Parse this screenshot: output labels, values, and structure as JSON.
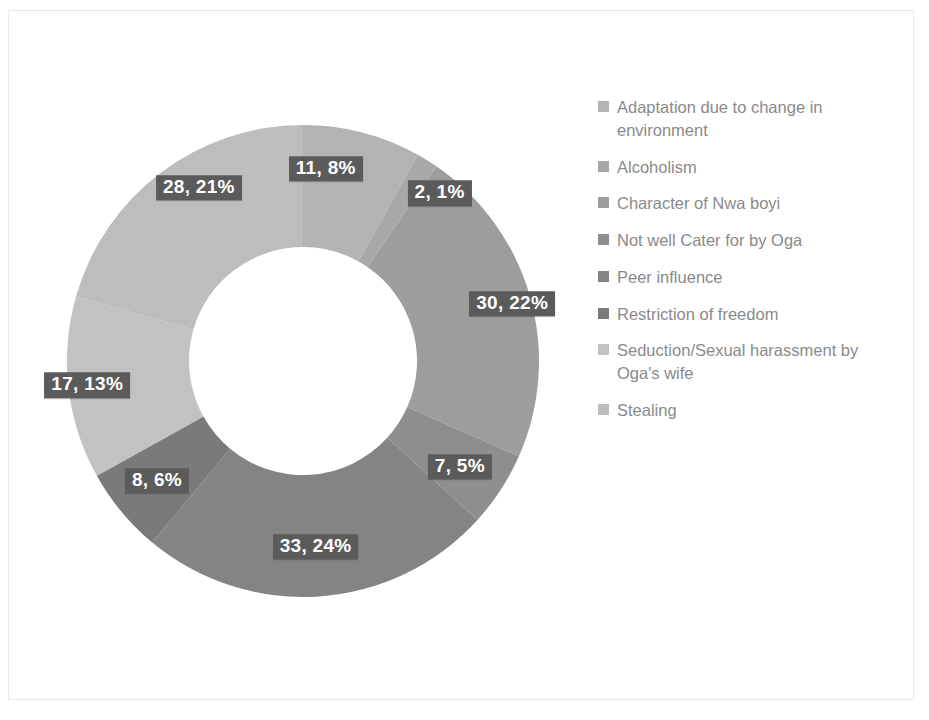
{
  "chart_data": {
    "type": "pie",
    "variant": "doughnut",
    "title": "",
    "subtitle": "",
    "xlabel": "",
    "ylabel": "",
    "grid": false,
    "legend_position": "right",
    "total": 136,
    "label_format": "value, percent",
    "start_angle_deg": 0,
    "direction": "clockwise",
    "categories": [
      "Adaptation due to change in environment",
      "Alcoholism",
      "Character of Nwa boyi",
      "Not well Cater for by Oga",
      "Peer influence",
      "Restriction of freedom",
      "Seduction/Sexual harassment by Oga's wife",
      "Stealing"
    ],
    "values": [
      11,
      2,
      30,
      7,
      33,
      8,
      17,
      28
    ],
    "percents": [
      8,
      1,
      22,
      5,
      24,
      6,
      13,
      21
    ],
    "colors": [
      "#b3b3b3",
      "#a8a8a8",
      "#9d9d9d",
      "#8e8e8e",
      "#848484",
      "#7a7a7a",
      "#c2c2c2",
      "#bdbdbd"
    ],
    "data_labels": [
      "11, 8%",
      "2, 1%",
      "30, 22%",
      "7, 5%",
      "33, 24%",
      "8, 6%",
      "17, 13%",
      "28, 21%"
    ]
  },
  "legend": {
    "items": [
      {
        "label": "Adaptation due to change in environment",
        "color": "#b3b3b3"
      },
      {
        "label": "Alcoholism",
        "color": "#a8a8a8"
      },
      {
        "label": "Character of Nwa boyi",
        "color": "#9d9d9d"
      },
      {
        "label": "Not well Cater for by Oga",
        "color": "#8e8e8e"
      },
      {
        "label": "Peer influence",
        "color": "#848484"
      },
      {
        "label": "Restriction of freedom",
        "color": "#7a7a7a"
      },
      {
        "label": "Seduction/Sexual harassment by Oga's wife",
        "color": "#c2c2c2"
      },
      {
        "label": "Stealing",
        "color": "#bdbdbd"
      }
    ]
  },
  "style": {
    "label_background": "#5b5b5b",
    "label_text_color": "#ffffff",
    "legend_text_color": "#8a8a8a",
    "background": "#ffffff"
  }
}
